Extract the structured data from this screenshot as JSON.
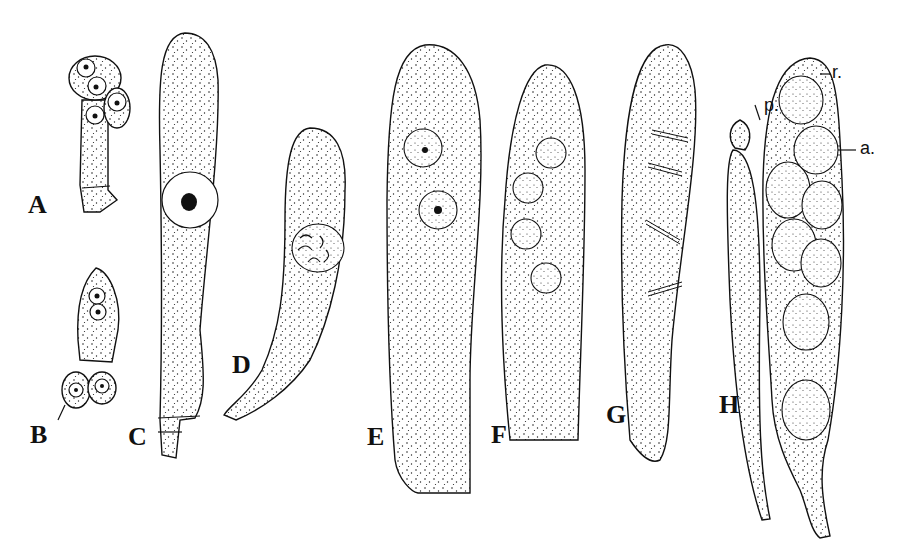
{
  "figure": {
    "panel_labels": [
      "A",
      "B",
      "C",
      "D",
      "E",
      "F",
      "G",
      "H"
    ],
    "annotations": {
      "p": "p.",
      "r": "r.",
      "a": "a."
    },
    "colors": {
      "ink": "#111111",
      "background": "#ffffff"
    }
  }
}
